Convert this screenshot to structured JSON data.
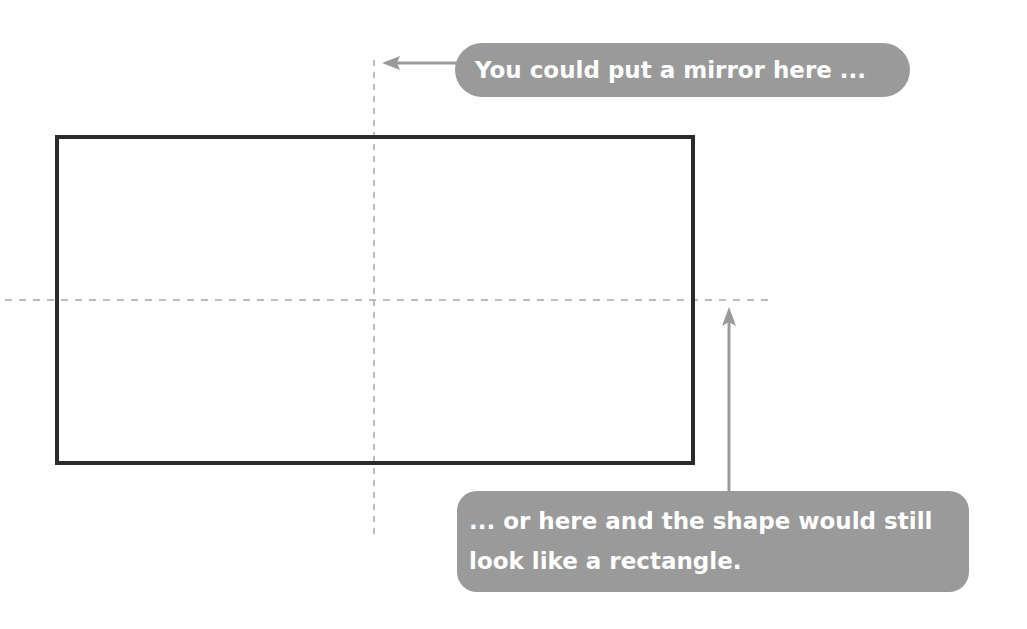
{
  "diagram": {
    "shape": {
      "type": "rectangle",
      "border_color": "#2b2b2b"
    },
    "symmetry_lines": [
      {
        "orientation": "vertical",
        "style": "dashed",
        "color": "#a8a8a8"
      },
      {
        "orientation": "horizontal",
        "style": "dashed",
        "color": "#a8a8a8"
      }
    ],
    "callouts": {
      "top": {
        "text": "You could put a mirror here ...",
        "points_to": "vertical-line",
        "arrow_direction": "left"
      },
      "bottom": {
        "line1": "... or here and the shape would still",
        "line2": "look like a rectangle.",
        "points_to": "horizontal-line",
        "arrow_direction": "up"
      }
    },
    "colors": {
      "callout_background": "#9a9a9a",
      "callout_text": "#ffffff",
      "arrow": "#9a9a9a"
    }
  }
}
